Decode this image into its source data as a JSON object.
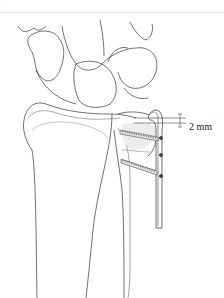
{
  "figure": {
    "header_label": "·",
    "annotation": {
      "label": "2 mm",
      "meaning": "plate distance below joint surface"
    },
    "parts": [
      "carpal-bones",
      "radius",
      "ulna",
      "fixation-plate",
      "proximal-screw",
      "distal-screw",
      "measurement-bracket"
    ],
    "colors": {
      "line": "#333333",
      "shade": "#e9e9e9",
      "background": "#ffffff"
    }
  }
}
